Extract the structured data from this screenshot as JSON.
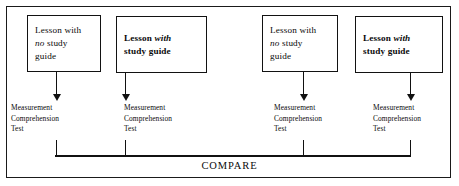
{
  "figure": {
    "type": "experimental-design-flow-diagram",
    "compare_label": "COMPARE"
  },
  "conditions": [
    {
      "id": "group-1",
      "emphasis": "regular",
      "lesson_line1_pre": "Lesson with",
      "lesson_line2_italic": "no",
      "lesson_line2_post": "study",
      "lesson_line3": "guide",
      "lesson_full": "Lesson with no study guide",
      "test_line1": "Measurement",
      "test_line2": "Comprehension",
      "test_line3": "Test"
    },
    {
      "id": "group-2",
      "emphasis": "bold",
      "lesson_line1_pre": "Lesson",
      "lesson_line1_italic": "with",
      "lesson_line2": "study guide",
      "lesson_full": "Lesson with study guide",
      "test_line1": "Measurement",
      "test_line2": "Comprehension",
      "test_line3": "Test"
    },
    {
      "id": "group-3",
      "emphasis": "regular",
      "lesson_line1_pre": "Lesson with",
      "lesson_line2_italic": "no",
      "lesson_line2_post": "study",
      "lesson_line3": "guide",
      "lesson_full": "Lesson with no study guide",
      "test_line1": "Measurement",
      "test_line2": "Comprehension",
      "test_line3": "Test"
    },
    {
      "id": "group-4",
      "emphasis": "bold",
      "lesson_line1_pre": "Lesson",
      "lesson_line1_italic": "with",
      "lesson_line2": "study guide",
      "lesson_full": "Lesson with study guide",
      "test_line1": "Measurement",
      "test_line2": "Comprehension",
      "test_line3": "Test"
    }
  ],
  "colors": {
    "ink": "#111111",
    "frame": "#1a1a1a",
    "background": "#ffffff"
  }
}
